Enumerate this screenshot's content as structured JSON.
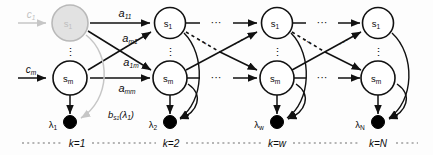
{
  "figure": {
    "type": "hmm-trellis-diagram",
    "title": "",
    "columns": [
      {
        "id": "k1",
        "time_label": "k=1",
        "x": 70,
        "top_node": {
          "label": "s",
          "sub": "1",
          "shaded": true,
          "faded": true
        },
        "bottom_node": {
          "label": "s",
          "sub": "m",
          "shaded": false,
          "faded": false
        },
        "vertical_dots": "⋮",
        "observation": {
          "label": "λ",
          "sub": "1"
        }
      },
      {
        "id": "k2",
        "time_label": "k=2",
        "x": 170,
        "top_node": {
          "label": "s",
          "sub": "1",
          "shaded": false,
          "faded": false
        },
        "bottom_node": {
          "label": "s",
          "sub": "m",
          "shaded": false,
          "faded": false
        },
        "vertical_dots": "⋮",
        "observation": {
          "label": "λ",
          "sub": "2"
        }
      },
      {
        "id": "kw",
        "time_label": "k=w",
        "x": 277,
        "top_node": {
          "label": "s",
          "sub": "1",
          "shaded": false,
          "faded": false
        },
        "bottom_node": {
          "label": "s",
          "sub": "m",
          "shaded": false,
          "faded": false
        },
        "vertical_dots": "⋮",
        "observation": {
          "label": "λ",
          "sub": "w"
        }
      },
      {
        "id": "kN",
        "time_label": "k=N",
        "x": 378,
        "top_node": {
          "label": "s",
          "sub": "1",
          "shaded": false,
          "faded": false
        },
        "bottom_node": {
          "label": "s",
          "sub": "m",
          "shaded": false,
          "faded": false
        },
        "vertical_dots": "⋮",
        "observation": {
          "label": "λ",
          "sub": "N"
        }
      }
    ],
    "inputs": [
      {
        "label": "c",
        "sub": "1",
        "faded": true
      },
      {
        "label": "c",
        "sub": "m",
        "faded": false
      }
    ],
    "transition_labels": [
      {
        "label": "a",
        "sub": "11",
        "x": 125,
        "y": 13
      },
      {
        "label": "a",
        "sub": "m1",
        "x": 131,
        "y": 38
      },
      {
        "label": "a",
        "sub": "1m",
        "x": 131,
        "y": 62
      },
      {
        "label": "a",
        "sub": "mm",
        "x": 127,
        "y": 87
      }
    ],
    "emission_label": {
      "label": "b",
      "sub": "s₁",
      "arg": "(λ₁)"
    },
    "horizontal_dots": "···",
    "colors": {
      "stroke": "#111111",
      "shaded_node_fill": "#d9d9d9",
      "faded_stroke": "#c6c6c6",
      "observation_fill": "#000000",
      "separator": "#6e6e6e",
      "background": "#fdfdfd"
    }
  }
}
